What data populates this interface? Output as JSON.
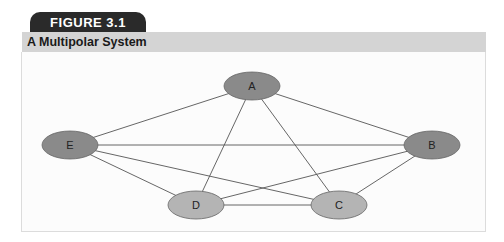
{
  "figure": {
    "tab_label": "FIGURE 3.1",
    "title": "A Multipolar System"
  },
  "diagram": {
    "type": "network",
    "nodes": [
      {
        "id": "A",
        "label": "A",
        "x": 252,
        "y": 86,
        "color": "#8a8a8a"
      },
      {
        "id": "B",
        "label": "B",
        "x": 432,
        "y": 145,
        "color": "#8a8a8a"
      },
      {
        "id": "C",
        "label": "C",
        "x": 339,
        "y": 205,
        "color": "#b4b4b4"
      },
      {
        "id": "D",
        "label": "D",
        "x": 196,
        "y": 205,
        "color": "#b4b4b4"
      },
      {
        "id": "E",
        "label": "E",
        "x": 70,
        "y": 145,
        "color": "#8a8a8a"
      }
    ],
    "edges": [
      [
        "A",
        "B"
      ],
      [
        "A",
        "C"
      ],
      [
        "A",
        "D"
      ],
      [
        "A",
        "E"
      ],
      [
        "B",
        "C"
      ],
      [
        "B",
        "D"
      ],
      [
        "B",
        "E"
      ],
      [
        "C",
        "D"
      ],
      [
        "C",
        "E"
      ],
      [
        "D",
        "E"
      ]
    ]
  },
  "colors": {
    "tab_bg": "#2a2a2a",
    "header_bg": "#d4d4d4",
    "node_dark": "#8a8a8a",
    "node_light": "#b4b4b4",
    "edge": "#555555"
  }
}
